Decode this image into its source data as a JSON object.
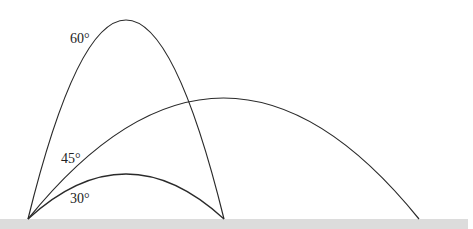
{
  "diagram": {
    "colors": {
      "curve": "#2a2a2a",
      "ground": "#dcdcdc",
      "background": "#ffffff"
    },
    "trajectories": [
      {
        "angle": 60,
        "label": "60°",
        "range": "short",
        "peak": "highest"
      },
      {
        "angle": 45,
        "label": "45°",
        "range": "maximum",
        "peak": "middle"
      },
      {
        "angle": 30,
        "label": "30°",
        "range": "short",
        "peak": "lowest"
      }
    ],
    "labels": {
      "a60": "60°",
      "a45": "45°",
      "a30": "30°"
    }
  }
}
